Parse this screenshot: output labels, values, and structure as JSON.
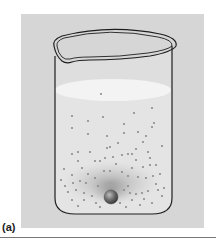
{
  "figure": {
    "label": "(a)",
    "colors": {
      "panel_bg": "#d6d6d6",
      "liquid": "#e6e6e6",
      "surface": "#f2f2f2",
      "outline": "#1e1e1e",
      "particle": "#8c8c8c",
      "sphere": "#6e6e6e"
    },
    "sphere": {
      "cx": 111,
      "cy": 197,
      "r": 7
    },
    "particles": [
      [
        101,
        94
      ],
      [
        72,
        116
      ],
      [
        152,
        108
      ],
      [
        134,
        113
      ],
      [
        72,
        128
      ],
      [
        88,
        121
      ],
      [
        103,
        117
      ],
      [
        124,
        124
      ],
      [
        154,
        123
      ],
      [
        152,
        127
      ],
      [
        88,
        134
      ],
      [
        107,
        136
      ],
      [
        124,
        133
      ],
      [
        138,
        132
      ],
      [
        162,
        146
      ],
      [
        107,
        148
      ],
      [
        72,
        154
      ],
      [
        78,
        152
      ],
      [
        90,
        152
      ],
      [
        110,
        147
      ],
      [
        118,
        143
      ],
      [
        143,
        142
      ],
      [
        146,
        136
      ],
      [
        105,
        158
      ],
      [
        113,
        157
      ],
      [
        122,
        155
      ],
      [
        128,
        154
      ],
      [
        132,
        154
      ],
      [
        148,
        152
      ],
      [
        136,
        149
      ],
      [
        64,
        169
      ],
      [
        78,
        161
      ],
      [
        95,
        161
      ],
      [
        100,
        161
      ],
      [
        116,
        164
      ],
      [
        136,
        160
      ],
      [
        156,
        165
      ],
      [
        72,
        175
      ],
      [
        88,
        174
      ],
      [
        104,
        171
      ],
      [
        110,
        171
      ],
      [
        122,
        172
      ],
      [
        132,
        168
      ],
      [
        143,
        167
      ],
      [
        150,
        165
      ],
      [
        65,
        186
      ],
      [
        73,
        183
      ],
      [
        80,
        181
      ],
      [
        86,
        183
      ],
      [
        95,
        178
      ],
      [
        128,
        176
      ],
      [
        138,
        177
      ],
      [
        146,
        178
      ],
      [
        153,
        176
      ],
      [
        160,
        174
      ],
      [
        156,
        184
      ],
      [
        68,
        192
      ],
      [
        76,
        190
      ],
      [
        84,
        193
      ],
      [
        92,
        196
      ],
      [
        124,
        190
      ],
      [
        130,
        193
      ],
      [
        136,
        194
      ],
      [
        142,
        193
      ],
      [
        148,
        191
      ],
      [
        158,
        190
      ],
      [
        162,
        196
      ],
      [
        72,
        200
      ],
      [
        84,
        200
      ],
      [
        96,
        203
      ],
      [
        120,
        203
      ],
      [
        132,
        200
      ],
      [
        144,
        199
      ],
      [
        152,
        203
      ],
      [
        78,
        206
      ],
      [
        100,
        207
      ],
      [
        126,
        207
      ],
      [
        140,
        205
      ],
      [
        164,
        188
      ],
      [
        61,
        180
      ],
      [
        98,
        186
      ],
      [
        128,
        186
      ],
      [
        82,
        168
      ],
      [
        150,
        158
      ]
    ]
  }
}
